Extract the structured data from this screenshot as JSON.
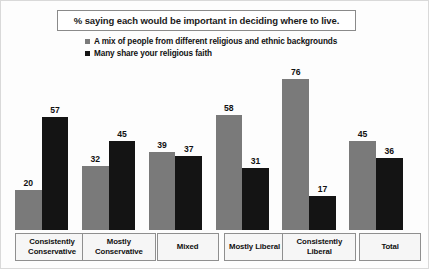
{
  "title": "% saying each would be important in deciding where to live.",
  "legend": [
    {
      "label": "A mix of people from different religious and ethnic backgrounds",
      "color": "#7a7a7a"
    },
    {
      "label": "Many share your religious faith",
      "color": "#141414"
    }
  ],
  "chart_data": {
    "type": "bar",
    "title": "% saying each would be important in deciding where to live.",
    "xlabel": "",
    "ylabel": "",
    "ylim": [
      0,
      85
    ],
    "grid": false,
    "legend_position": "top-left",
    "categories": [
      "Consistently Conservative",
      "Mostly Conservative",
      "Mixed",
      "Mostly Liberal",
      "Consistently Liberal",
      "Total"
    ],
    "series": [
      {
        "name": "A mix of people from different religious and ethnic backgrounds",
        "color": "#7a7a7a",
        "values": [
          20,
          32,
          39,
          58,
          76,
          45
        ]
      },
      {
        "name": "Many share your religious faith",
        "color": "#141414",
        "values": [
          57,
          45,
          37,
          31,
          17,
          36
        ]
      }
    ]
  }
}
